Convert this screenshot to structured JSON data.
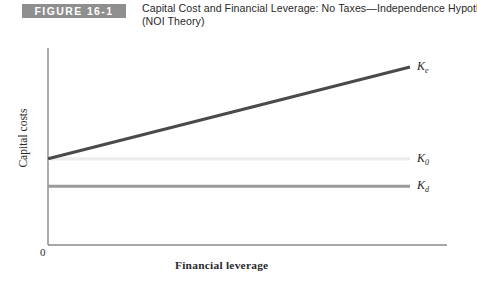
{
  "header": {
    "badge_label": "FIGURE 16-1",
    "badge_color": "#8f8f8f",
    "title_line1": "Capital Cost and Financial Leverage: No Taxes—Independence Hypothesis",
    "title_line2": "(NOI Theory)"
  },
  "chart_data": {
    "type": "line",
    "title": "Capital Cost and Financial Leverage: No Taxes—Independence Hypothesis (NOI Theory)",
    "xlabel": "Financial leverage",
    "ylabel": "Capital costs",
    "origin_label": "0",
    "grid": false,
    "legend_position": "right-inline",
    "xlim": [
      0,
      100
    ],
    "ylim": [
      0,
      100
    ],
    "axis_color": "#8a8a8a",
    "series": [
      {
        "name": "Ke",
        "label_text": "K",
        "label_sub": "e",
        "color": "#4a4a4a",
        "x": [
          0,
          100
        ],
        "values": [
          38,
          95
        ],
        "description": "cost of equity rises linearly with financial leverage"
      },
      {
        "name": "K0",
        "label_text": "K",
        "label_sub": "0",
        "color": "#ededed",
        "x": [
          0,
          100
        ],
        "values": [
          38,
          38
        ],
        "description": "overall cost of capital stays constant"
      },
      {
        "name": "Kd",
        "label_text": "K",
        "label_sub": "d",
        "color": "#9a9a9a",
        "x": [
          0,
          100
        ],
        "values": [
          21,
          21
        ],
        "description": "cost of debt stays constant"
      }
    ]
  }
}
